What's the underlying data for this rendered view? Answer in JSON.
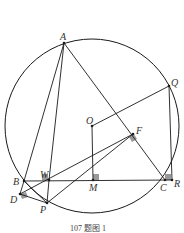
{
  "caption": "107 题图 1",
  "colors": {
    "line": "#1a1a1a",
    "marker": "#999999",
    "background": "#ffffff"
  },
  "circle": {
    "cx": 92,
    "cy": 126,
    "r": 87
  },
  "points": {
    "A": {
      "x": 64,
      "y": 43,
      "label": "A"
    },
    "Q": {
      "x": 169,
      "y": 86,
      "label": "Q"
    },
    "O": {
      "x": 92,
      "y": 126,
      "label": "O"
    },
    "F": {
      "x": 133,
      "y": 134,
      "label": "F"
    },
    "B": {
      "x": 24,
      "y": 181,
      "label": "B"
    },
    "W": {
      "x": 49,
      "y": 180,
      "label": "W"
    },
    "M": {
      "x": 93,
      "y": 180,
      "label": "M"
    },
    "C": {
      "x": 165,
      "y": 180,
      "label": "C"
    },
    "R": {
      "x": 172,
      "y": 180,
      "label": "R"
    },
    "D": {
      "x": 20,
      "y": 194,
      "label": "D"
    },
    "P": {
      "x": 47,
      "y": 203,
      "label": "P"
    }
  }
}
